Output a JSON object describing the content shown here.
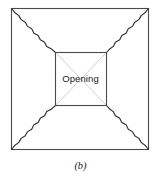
{
  "figure": {
    "caption": "(b)",
    "opening_label": "Opening",
    "colors": {
      "outline": "#4a4a4a",
      "crack": "#2b2b2b",
      "diagonal": "#c9c9c9",
      "background": "#ffffff"
    },
    "outer_square": {
      "x": 11.5,
      "y": 8.5,
      "width": 137,
      "height": 141
    },
    "inner_square": {
      "x": 55.5,
      "y": 52.5,
      "width": 51,
      "height": 53
    },
    "crack_lines": [
      {
        "name": "crack-top-left",
        "from": [
          11.5,
          8.5
        ],
        "to": [
          55.5,
          52.5
        ]
      },
      {
        "name": "crack-top-right",
        "from": [
          148.5,
          8.5
        ],
        "to": [
          106.5,
          52.5
        ]
      },
      {
        "name": "crack-bottom-left",
        "from": [
          11.5,
          149.5
        ],
        "to": [
          55.5,
          105.5
        ]
      },
      {
        "name": "crack-bottom-right",
        "from": [
          148.5,
          149.5
        ],
        "to": [
          106.5,
          105.5
        ]
      }
    ],
    "opening_diagonals": [
      {
        "name": "opening-diagonal-nwse",
        "from": [
          55.5,
          52.5
        ],
        "to": [
          106.5,
          105.5
        ]
      },
      {
        "name": "opening-diagonal-nesw",
        "from": [
          106.5,
          52.5
        ],
        "to": [
          55.5,
          105.5
        ]
      }
    ]
  }
}
